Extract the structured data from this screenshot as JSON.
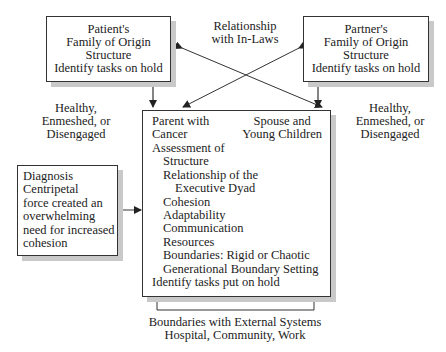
{
  "patient_box": {
    "lines": [
      "Patient's",
      "Family of Origin",
      "Structure",
      "Identify tasks on hold"
    ]
  },
  "partner_box": {
    "lines": [
      "Partner's",
      "Family of Origin",
      "Structure",
      "Identify tasks on hold"
    ]
  },
  "inlaws_label": {
    "lines": [
      "Relationship",
      "with In-Laws"
    ]
  },
  "left_health_label": {
    "lines": [
      "Healthy,",
      "Enmeshed, or",
      "Disengaged"
    ]
  },
  "right_health_label": {
    "lines": [
      "Healthy,",
      "Enmeshed, or",
      "Disengaged"
    ]
  },
  "diagnosis_box": {
    "lines": [
      "Diagnosis",
      "Centripetal",
      "force created an",
      "overwhelming",
      "need for increased",
      "cohesion"
    ]
  },
  "central_box": {
    "parent": [
      "Parent with",
      "Cancer"
    ],
    "spouse": [
      "Spouse and",
      "Young Children"
    ],
    "assessment_heading": "Assessment of",
    "items": [
      {
        "text": "Structure",
        "indent": 1
      },
      {
        "text": "Relationship of the",
        "indent": 1
      },
      {
        "text": "Executive Dyad",
        "indent": 2
      },
      {
        "text": "Cohesion",
        "indent": 1
      },
      {
        "text": "Adaptability",
        "indent": 1
      },
      {
        "text": "Communication",
        "indent": 1
      },
      {
        "text": "Resources",
        "indent": 1
      },
      {
        "text": "Boundaries: Rigid or Chaotic",
        "indent": 1
      },
      {
        "text": "Generational Boundary Setting",
        "indent": 1
      }
    ],
    "footer": "Identify tasks put on hold"
  },
  "external_label": {
    "lines": [
      "Boundaries with External Systems",
      "Hospital, Community, Work"
    ]
  },
  "colors": {
    "line": "#333333",
    "shadow": "#c9c9c9",
    "text": "#222222"
  }
}
